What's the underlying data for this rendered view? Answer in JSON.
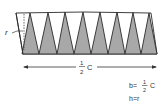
{
  "diagram": {
    "colors": {
      "sector_fill": "#a8a8a8",
      "outline": "#2a2a2a",
      "background": "#ffffff",
      "text": "#333333"
    },
    "labels": {
      "radius": "r",
      "base_fraction_num": "1",
      "base_fraction_den": "2",
      "base_symbol": "C",
      "formula_b_lhs": "b=",
      "formula_b_num": "1",
      "formula_b_den": "2",
      "formula_b_symbol": "C",
      "formula_h": "h=r"
    },
    "sector_count_shaded": 8
  }
}
